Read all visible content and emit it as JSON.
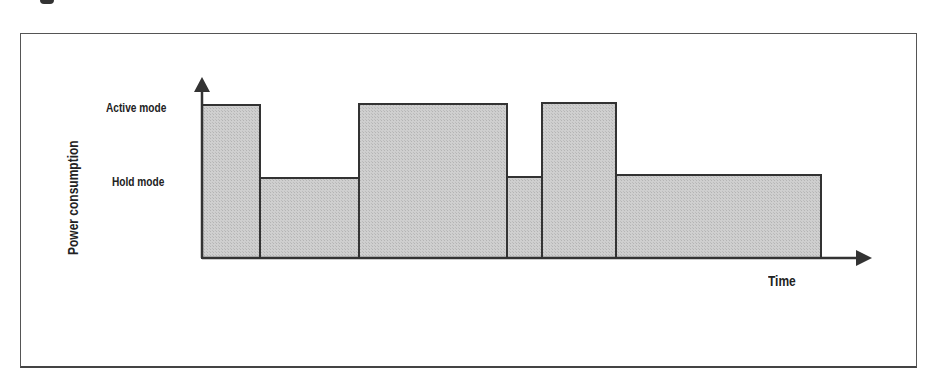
{
  "diagram": {
    "y_axis_label": "Power consumption",
    "x_axis_label": "Time",
    "levels": [
      {
        "name": "Active mode"
      },
      {
        "name": "Hold mode"
      }
    ],
    "segments": [
      {
        "mode": "Active mode",
        "start": 0,
        "end": 58
      },
      {
        "mode": "Hold mode",
        "start": 58,
        "end": 157
      },
      {
        "mode": "Active mode",
        "start": 157,
        "end": 305
      },
      {
        "mode": "Hold mode",
        "start": 305,
        "end": 340
      },
      {
        "mode": "Active mode",
        "start": 340,
        "end": 414
      },
      {
        "mode": "Hold mode",
        "start": 414,
        "end": 619
      }
    ],
    "colors": {
      "fill": "#c8c8c8",
      "stroke": "#333333",
      "frame": "#555555"
    }
  }
}
